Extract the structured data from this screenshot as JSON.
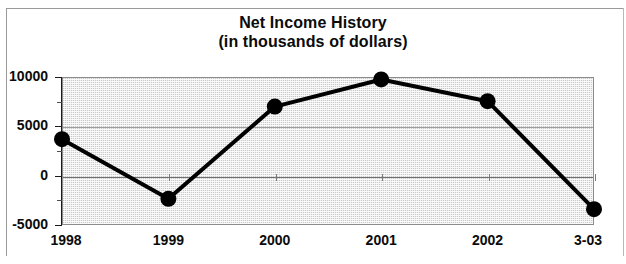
{
  "chart_data": {
    "type": "line",
    "title": "Net Income History",
    "subtitle": "(in thousands of dollars)",
    "title_lines": [
      "Net Income History",
      "(in thousands of dollars)"
    ],
    "xlabel": "",
    "ylabel": "",
    "categories": [
      "1998",
      "1999",
      "2000",
      "2001",
      "2002",
      "3-03"
    ],
    "values": [
      3700,
      -2350,
      7000,
      9750,
      7550,
      -3400
    ],
    "series": [
      {
        "name": "Net Income",
        "values": [
          3700,
          -2350,
          7000,
          9750,
          7550,
          -3400
        ]
      }
    ],
    "ylim": [
      -5000,
      10000
    ],
    "ytick_labels": [
      "10000",
      "5000",
      "0",
      "-5000"
    ],
    "ytick_values": [
      10000,
      5000,
      0,
      -5000
    ],
    "yminor_values": [
      7500,
      2500,
      -2500
    ],
    "grid": true,
    "gridlines_at": [
      10000,
      5000,
      0,
      -5000
    ],
    "legend": "none",
    "legend_position": "none",
    "marker": "filled-circle",
    "marker_color": "#000000",
    "line_color": "#000000",
    "line_width": 4,
    "plot_background": "#ededed",
    "plot_border_color": "#8c8c8c",
    "text_color": "#0b0b0b"
  }
}
